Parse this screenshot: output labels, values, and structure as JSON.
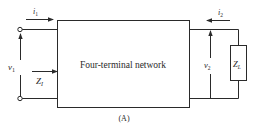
{
  "diagram": {
    "network_label": "Four-terminal network",
    "caption": "(A)",
    "input": {
      "current_label": "i",
      "current_sub": "1",
      "voltage_label": "v",
      "voltage_sub": "1",
      "impedance_label": "Z",
      "impedance_sub": "I"
    },
    "output": {
      "current_label": "i",
      "current_sub": "2",
      "voltage_label": "v",
      "voltage_sub": "2",
      "load_label": "Z",
      "load_sub": "L"
    },
    "colors": {
      "stroke": "#2a2a2a",
      "background": "#ffffff"
    }
  }
}
